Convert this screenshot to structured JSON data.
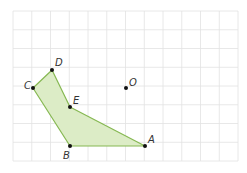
{
  "diagram": {
    "type": "grid-geometry",
    "grid": {
      "x0": 13,
      "y0": 11,
      "cols": 12,
      "rows": 8,
      "cell": 18.75,
      "line_color": "#e2e2e2",
      "border_color": "#e6e6e6"
    },
    "polygon": {
      "vertices": [
        "A",
        "B",
        "C",
        "D",
        "E"
      ],
      "fill": "#dcecc6",
      "stroke": "#86b852"
    },
    "points": [
      {
        "name": "A",
        "label": "A",
        "x": 145,
        "y": 146,
        "lx": 148,
        "ly": 143
      },
      {
        "name": "B",
        "label": "B",
        "x": 70,
        "y": 146,
        "lx": 63,
        "ly": 159
      },
      {
        "name": "C",
        "label": "C",
        "x": 33,
        "y": 88,
        "lx": 24,
        "ly": 89
      },
      {
        "name": "D",
        "label": "D",
        "x": 52,
        "y": 70,
        "lx": 55,
        "ly": 66
      },
      {
        "name": "E",
        "label": "E",
        "x": 70,
        "y": 107,
        "lx": 73,
        "ly": 104
      },
      {
        "name": "O",
        "label": "O",
        "x": 126,
        "y": 88,
        "lx": 129,
        "ly": 86
      }
    ],
    "point_color": "#111111"
  }
}
